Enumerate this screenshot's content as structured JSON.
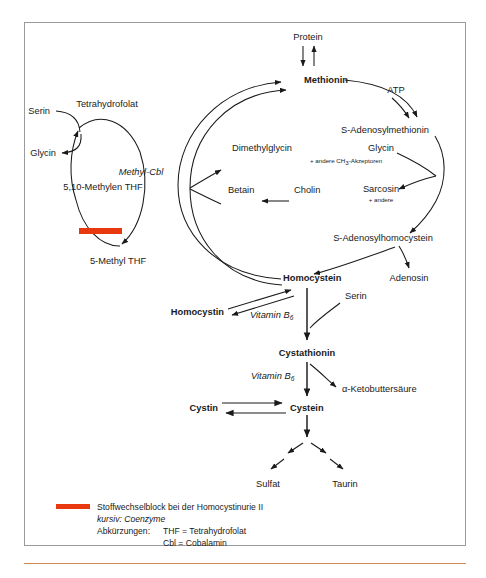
{
  "diagram": {
    "nodes": {
      "protein": "Protein",
      "methionin": "Methionin",
      "atp": "ATP",
      "sam": "S-Adenosylmethionin",
      "glycin_right": "Glycin",
      "ch3_akzeptoren": "+ andere CH",
      "ch3_sub": "3",
      "ch3_rest": "-Akzeptoren",
      "sarcosin": "Sarcosin",
      "sarcosin_sub": "+ andere",
      "sah": "S-Adenosylhomocystein",
      "adenosin": "Adenosin",
      "dimethylglycin": "Dimethylglycin",
      "betain": "Betain",
      "cholin": "Cholin",
      "homocystein": "Homocystein",
      "homocystin": "Homocystin",
      "serin_right": "Serin",
      "cystathionin": "Cystathionin",
      "ketobuttersaeure": "α-Ketobuttersäure",
      "cystein": "Cystein",
      "cystin": "Cystin",
      "sulfat": "Sulfat",
      "taurin": "Taurin",
      "tetrahydrofolat": "Tetrahydrofolat",
      "serin_left": "Serin",
      "glycin_left": "Glycin",
      "methylen_thf": "5,10-Methylen THF",
      "methyl_thf": "5-Methyl THF",
      "methyl_cbl": "Methyl-Cbl",
      "vitamin_b6_a": "Vitamin B",
      "vitamin_b6_a_sub": "6",
      "vitamin_b6_b": "Vitamin B",
      "vitamin_b6_b_sub": "6"
    },
    "legend": {
      "block_text": "Stoffwechselblock bei der Homocystinurie II",
      "coenzyme_text": "kursiv: Coenzyme",
      "abbrev_label": "Abkürzungen:",
      "abbrev_1": "THF = Tetrahydrofolat",
      "abbrev_2": "Cbl = Cobalamin"
    },
    "colors": {
      "block_red": "#e8380d",
      "frame_border": "#9a9a9e",
      "rule_orange": "#d08a56",
      "ink": "#1a1a1a",
      "background": "#ffffff"
    }
  }
}
